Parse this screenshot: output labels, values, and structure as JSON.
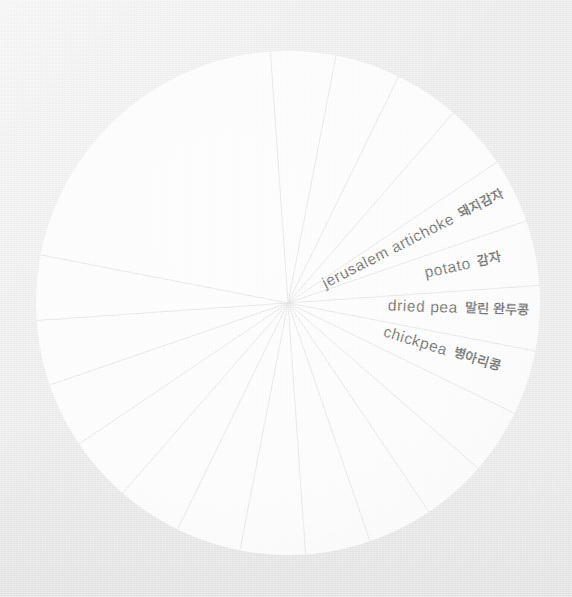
{
  "canvas": {
    "width": 572,
    "height": 597
  },
  "background": {
    "color": "#ececec",
    "texture": "paper-grain"
  },
  "chart_data": {
    "type": "pie",
    "title": "",
    "subtitle": "",
    "xlabel": "",
    "ylabel": "",
    "legend_position": "none",
    "grid": false,
    "center": {
      "x": 288,
      "y": 303
    },
    "radius": 252,
    "slice_count": 16,
    "slice_fill": "#ffffff",
    "slice_stroke": "#e3e3e3",
    "label_color": "#6d6d6d",
    "categories": [
      "jerusalem artichoke",
      "potato",
      "dried pea",
      "chickpea",
      "",
      "",
      "",
      "",
      "",
      "",
      "",
      "",
      "",
      "",
      "",
      ""
    ],
    "values": [
      6.25,
      6.25,
      6.25,
      6.25,
      6.25,
      6.25,
      6.25,
      6.25,
      6.25,
      6.25,
      6.25,
      6.25,
      6.25,
      6.25,
      6.25,
      6.25
    ],
    "labels": [
      {
        "id": "jerusalem-artichoke",
        "en": "jerusalem artichoke",
        "ko": "돼지감자",
        "anchor_x": 288,
        "anchor_y": 303,
        "angle_deg": -27,
        "radius_start": 40,
        "visible": true
      },
      {
        "id": "potato",
        "en": "potato",
        "ko": "감자",
        "anchor_x": 288,
        "anchor_y": 303,
        "angle_deg": -12,
        "radius_start": 140,
        "visible": true
      },
      {
        "id": "dried-pea",
        "en": "dried pea",
        "ko": "말린 완두콩",
        "anchor_x": 288,
        "anchor_y": 303,
        "angle_deg": 2,
        "radius_start": 100,
        "visible": true
      },
      {
        "id": "chickpea",
        "en": "chickpea",
        "ko": "병아리콩",
        "anchor_x": 288,
        "anchor_y": 303,
        "angle_deg": 17,
        "radius_start": 100,
        "visible": true
      }
    ],
    "spoke_angles_deg": [
      -94,
      -79,
      -64,
      -49,
      -34,
      -19,
      -4,
      11,
      26,
      41,
      56,
      71,
      86,
      101,
      116,
      131,
      146,
      161,
      176,
      191
    ]
  }
}
